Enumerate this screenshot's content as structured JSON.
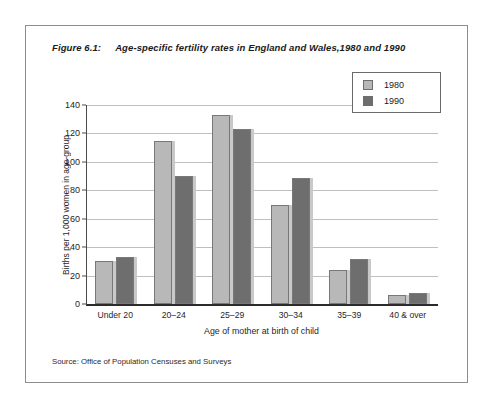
{
  "figure": {
    "number": "Figure 6.1:",
    "title": "Age-specific fertility rates in England and Wales,1980 and 1990",
    "source": "Source: Office of Population Censuses and Surveys"
  },
  "legend": {
    "position": "top-right",
    "entries": [
      {
        "label": "1980",
        "color": "#b8b8b8"
      },
      {
        "label": "1990",
        "color": "#6e6e6e"
      }
    ]
  },
  "colors": {
    "series_1980": "#b8b8b8",
    "series_1990": "#6e6e6e",
    "bar_outline": "#787878",
    "bar_shadow": "#c9c9c9",
    "gridline": "#bfbfbf",
    "axis": "#2b2b2b",
    "frame": "#8d8d8d",
    "text": "#1a1a1a"
  },
  "chart_data": {
    "type": "bar",
    "title": "Age-specific fertility rates in England and Wales,1980 and 1990",
    "xlabel": "Age of mother at birth of child",
    "ylabel": "Births per 1,000 women in age-group",
    "categories": [
      "Under 20",
      "20–24",
      "25–29",
      "30–34",
      "35–39",
      "40 & over"
    ],
    "series": [
      {
        "name": "1980",
        "values": [
          30,
          115,
          133,
          70,
          24,
          6
        ]
      },
      {
        "name": "1990",
        "values": [
          33,
          90,
          123,
          89,
          32,
          8
        ]
      }
    ],
    "ylim": [
      0,
      140
    ],
    "yticks": [
      0,
      20,
      40,
      60,
      80,
      100,
      120,
      140
    ],
    "ytick_labels": [
      "0",
      "20",
      "40",
      "60",
      "80",
      "100",
      "120",
      "140"
    ],
    "grid": true,
    "legend_position": "top-right"
  }
}
